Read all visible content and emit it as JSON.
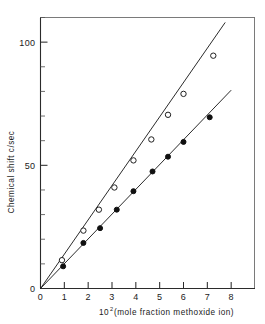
{
  "figure": {
    "background_color": "#ffffff",
    "ink_color": "#1a1a1a"
  },
  "axes": {
    "x": {
      "title_main": "(mole fraction methoxide ion)",
      "title_base": "10",
      "title_exponent": "2",
      "tick_labels": [
        "0",
        "1",
        "2",
        "3",
        "4",
        "5",
        "6",
        "7",
        "8"
      ],
      "tick_values": [
        0,
        1,
        2,
        3,
        4,
        5,
        6,
        7,
        8
      ],
      "range": [
        0,
        9.0
      ]
    },
    "y": {
      "title": "Chemical shift  c/sec",
      "tick_labels": [
        "0",
        "50",
        "100"
      ],
      "tick_values": [
        0,
        50,
        100
      ],
      "minor_step": 10,
      "range": [
        0,
        110
      ]
    }
  },
  "chart_data": {
    "type": "scatter",
    "title": "",
    "xlabel": "10^2 (mole fraction methoxide ion)",
    "ylabel": "Chemical shift c/sec",
    "xlim": [
      0,
      9.0
    ],
    "ylim": [
      0,
      110
    ],
    "grid": false,
    "legend": "none",
    "series": [
      {
        "name": "open-circle-series",
        "marker": "open-circle",
        "color": "#202020",
        "slope": 13.0,
        "fit_line": {
          "x": [
            0,
            7.75
          ],
          "y": [
            0,
            108.0
          ]
        },
        "points": [
          {
            "x": 0.9,
            "y": 11.5
          },
          {
            "x": 1.8,
            "y": 23.5
          },
          {
            "x": 2.45,
            "y": 32.0
          },
          {
            "x": 3.1,
            "y": 41.0
          },
          {
            "x": 3.9,
            "y": 52.0
          },
          {
            "x": 4.65,
            "y": 60.5
          },
          {
            "x": 5.35,
            "y": 70.5
          },
          {
            "x": 6.0,
            "y": 79.0
          },
          {
            "x": 7.25,
            "y": 94.5
          }
        ]
      },
      {
        "name": "filled-circle-series",
        "marker": "filled-circle",
        "color": "#101010",
        "slope": 9.9,
        "fit_line": {
          "x": [
            0,
            8.0
          ],
          "y": [
            0,
            80.5
          ]
        },
        "points": [
          {
            "x": 0.95,
            "y": 9.0
          },
          {
            "x": 1.8,
            "y": 18.5
          },
          {
            "x": 2.5,
            "y": 24.5
          },
          {
            "x": 3.2,
            "y": 32.0
          },
          {
            "x": 3.9,
            "y": 39.5
          },
          {
            "x": 4.7,
            "y": 47.5
          },
          {
            "x": 5.35,
            "y": 53.5
          },
          {
            "x": 6.0,
            "y": 59.5
          },
          {
            "x": 7.1,
            "y": 69.5
          }
        ]
      }
    ]
  }
}
